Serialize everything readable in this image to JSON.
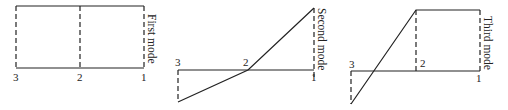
{
  "diagram": {
    "panels": [
      {
        "title": "First mode",
        "nodes": [
          "3",
          "2",
          "1"
        ],
        "displacements": {
          "node3": 1,
          "node2": 1,
          "node1": 1
        }
      },
      {
        "title": "Second mode",
        "nodes": [
          "3",
          "2",
          "1"
        ],
        "displacements": {
          "node3": -0.5,
          "node2": 0,
          "node1": 1
        }
      },
      {
        "title": "Third mode",
        "nodes": [
          "3",
          "2",
          "1"
        ],
        "displacements": {
          "node3": -0.55,
          "node2": 1,
          "node1": 1
        }
      }
    ]
  }
}
